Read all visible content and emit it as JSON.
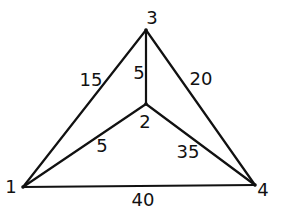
{
  "diagram": {
    "type": "weighted-graph",
    "nodes": [
      {
        "id": "1",
        "label": "1",
        "x": 23,
        "y": 187,
        "lx": 11,
        "ly": 193
      },
      {
        "id": "2",
        "label": "2",
        "x": 146,
        "y": 104,
        "lx": 145,
        "ly": 128
      },
      {
        "id": "3",
        "label": "3",
        "x": 146,
        "y": 30,
        "lx": 152,
        "ly": 24
      },
      {
        "id": "4",
        "label": "4",
        "x": 255,
        "y": 185,
        "lx": 263,
        "ly": 196
      }
    ],
    "edges": [
      {
        "from": "1",
        "to": "3",
        "weight": "15",
        "lx": 91,
        "ly": 86
      },
      {
        "from": "2",
        "to": "3",
        "weight": "5",
        "lx": 139,
        "ly": 79
      },
      {
        "from": "3",
        "to": "4",
        "weight": "20",
        "lx": 201,
        "ly": 85
      },
      {
        "from": "1",
        "to": "2",
        "weight": "5",
        "lx": 102,
        "ly": 152
      },
      {
        "from": "2",
        "to": "4",
        "weight": "35",
        "lx": 188,
        "ly": 158
      },
      {
        "from": "1",
        "to": "4",
        "weight": "40",
        "lx": 143,
        "ly": 206
      }
    ]
  },
  "colors": {
    "line": "#111111",
    "background": "#ffffff"
  }
}
